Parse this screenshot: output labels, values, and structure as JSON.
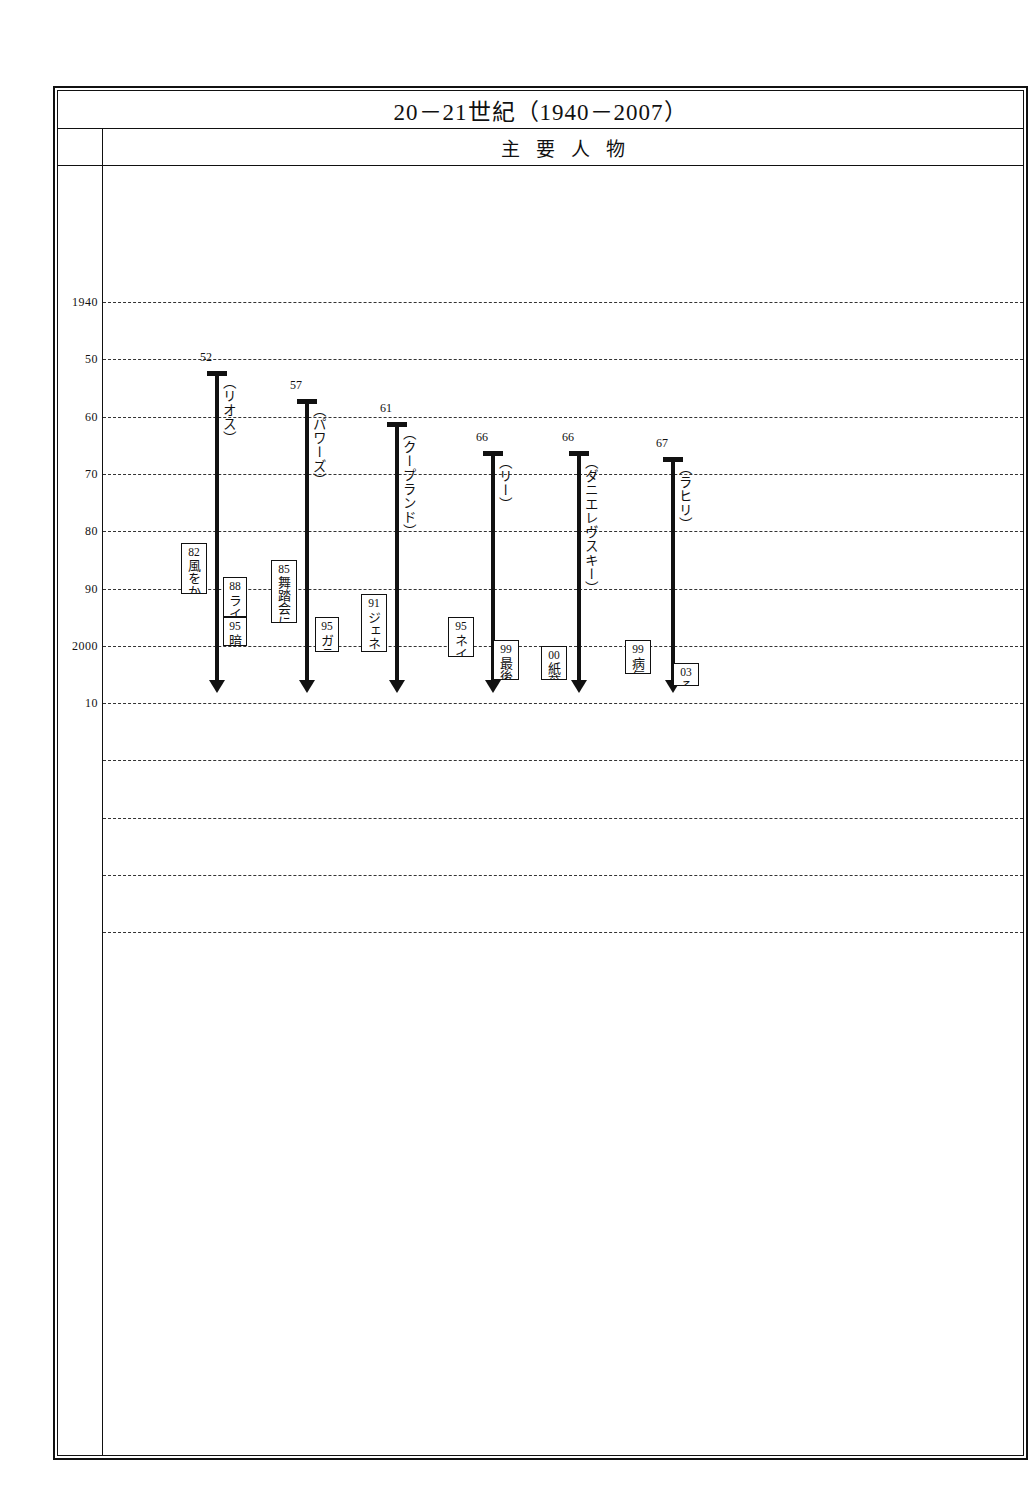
{
  "header": {
    "title": "20－21世紀（1940－2007）",
    "subtitle": "主要人物"
  },
  "axis": {
    "ticks": [
      {
        "label": "1940",
        "year": 1940
      },
      {
        "label": "50",
        "year": 1950
      },
      {
        "label": "60",
        "year": 1960
      },
      {
        "label": "70",
        "year": 1970
      },
      {
        "label": "80",
        "year": 1980
      },
      {
        "label": "90",
        "year": 1990
      },
      {
        "label": "2000",
        "year": 2000
      },
      {
        "label": "10",
        "year": 2010
      },
      {
        "label": "",
        "year": 2020
      },
      {
        "label": "",
        "year": 2030
      },
      {
        "label": "",
        "year": 2040
      },
      {
        "label": "",
        "year": 2050
      }
    ],
    "grid": true,
    "range": [
      1935,
      2060
    ]
  },
  "people": [
    {
      "name": "（リオス）",
      "birth_label": "52",
      "birth_year": 1952,
      "end_year": 2006,
      "works": [
        {
          "year_label": "82",
          "title": "風をからかうための嘘き",
          "year": 1982,
          "end_year": 1991
        },
        {
          "year_label": "88",
          "title": "ライム園の女",
          "year": 1988,
          "end_year": 1995
        },
        {
          "year_label": "95",
          "title": "暗号",
          "year": 1995,
          "end_year": 2000
        }
      ]
    },
    {
      "name": "（パワーズ）",
      "birth_label": "57",
      "birth_year": 1957,
      "end_year": 2006,
      "works": [
        {
          "year_label": "85",
          "title": "舞踏会に向かう三人の農夫",
          "year": 1985,
          "end_year": 1996
        },
        {
          "year_label": "95",
          "title": "ガラテア2・2",
          "year": 1995,
          "end_year": 2001
        }
      ]
    },
    {
      "name": "（クープランド）",
      "birth_label": "61",
      "birth_year": 1961,
      "end_year": 2006,
      "works": [
        {
          "year_label": "91",
          "title": "ジェネレーションX",
          "year": 1991,
          "end_year": 2001
        }
      ]
    },
    {
      "name": "（リー）",
      "birth_label": "66",
      "birth_year": 1966,
      "end_year": 2006,
      "works": [
        {
          "year_label": "95",
          "title": "ネイティヴ・スピーカー",
          "year": 1995,
          "end_year": 2002
        },
        {
          "year_label": "99",
          "title": "最後の場所で",
          "year": 1999,
          "end_year": 2006
        }
      ]
    },
    {
      "name": "（ダニエレヴスキー）",
      "birth_label": "66",
      "birth_year": 1966,
      "end_year": 2006,
      "works": [
        {
          "year_label": "00",
          "title": "紙葉の家",
          "year": 2000,
          "end_year": 2006
        }
      ]
    },
    {
      "name": "（ラヒリ）",
      "birth_label": "67",
      "birth_year": 1967,
      "end_year": 2006,
      "works": [
        {
          "year_label": "99",
          "title": "病気の通訳",
          "year": 1999,
          "end_year": 2005
        },
        {
          "year_label": "03",
          "title": "その名にちなんで",
          "year": 2003,
          "end_year": 2007
        }
      ]
    }
  ]
}
